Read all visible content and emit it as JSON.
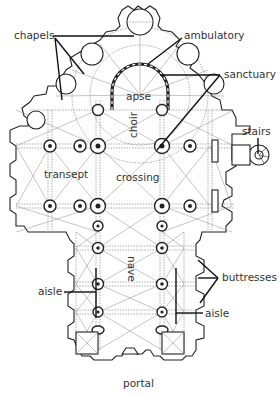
{
  "diagram": {
    "type": "architectural floor plan",
    "colors": {
      "line": "#222222",
      "background": "#ffffff",
      "label": "#333333"
    },
    "labels": {
      "chapels": "chapels",
      "ambulatory": "ambulatory",
      "apse": "apse",
      "sanctuary": "sanctuary",
      "choir": "choir",
      "stairs": "stairs",
      "transept": "transept",
      "crossing": "crossing",
      "nave": "nave",
      "buttresses": "buttresses",
      "aisle_left": "aisle",
      "aisle_right": "aisle",
      "portal": "portal"
    }
  }
}
